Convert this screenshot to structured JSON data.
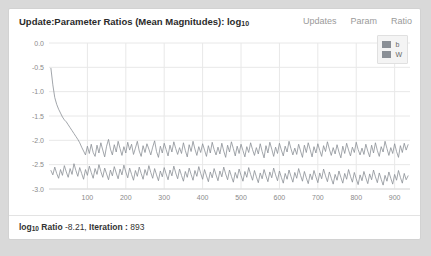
{
  "card": {
    "title_main": "Update:Parameter Ratios (Mean Magnitudes): log",
    "title_sub": "10"
  },
  "tabs": [
    {
      "label": "Updates"
    },
    {
      "label": "Param"
    },
    {
      "label": "Ratio"
    }
  ],
  "legend": {
    "position": "top-right",
    "items": [
      {
        "label": "b",
        "color": "#8a8f96"
      },
      {
        "label": "W",
        "color": "#8a8f96"
      }
    ]
  },
  "footer": {
    "prefix": "log",
    "prefix_sub": "10",
    "ratio_label": "Ratio",
    "ratio_value": "-8.21",
    "separator": ",",
    "iteration_label": "Iteration :",
    "iteration_value": "893"
  },
  "colors": {
    "page_background": "#d9d9d9",
    "card_background": "#ffffff",
    "card_border": "#d2d2d2",
    "grid": "#e8e8e8",
    "axis_text": "#8a8a8a",
    "series_b": "#8a8f96",
    "series_w": "#8a8f96",
    "title_text": "#2b2b2b",
    "tab_text": "#9a9a9a"
  },
  "chart_data": {
    "type": "line",
    "title": "Update:Parameter Ratios (Mean Magnitudes): log10",
    "xlabel": "",
    "ylabel": "",
    "xlim": [
      0,
      940
    ],
    "ylim": [
      -3.0,
      0.0
    ],
    "grid": true,
    "legend_position": "top-right",
    "xticks": [
      100,
      200,
      300,
      400,
      500,
      600,
      700,
      800,
      900
    ],
    "yticks": [
      "0.0",
      "-0.5",
      "-1.0",
      "-1.5",
      "-2.0",
      "-2.5",
      "-3.0"
    ],
    "x_start": 5,
    "x_step": 5,
    "series": [
      {
        "name": "b",
        "color": "#8a8f96",
        "values": [
          -0.52,
          -0.86,
          -1.12,
          -1.26,
          -1.36,
          -1.44,
          -1.52,
          -1.58,
          -1.62,
          -1.68,
          -1.74,
          -1.8,
          -1.86,
          -1.92,
          -1.98,
          -2.05,
          -2.14,
          -2.22,
          -2.3,
          -2.12,
          -2.27,
          -2.08,
          -2.25,
          -2.33,
          -2.1,
          -2.26,
          -2.05,
          -2.2,
          -2.34,
          -2.12,
          -1.98,
          -2.18,
          -2.3,
          -2.09,
          -2.24,
          -2.02,
          -2.17,
          -2.31,
          -2.13,
          -2.26,
          -2.04,
          -2.2,
          -2.08,
          -2.29,
          -2.16,
          -2.02,
          -2.22,
          -2.33,
          -2.11,
          -2.25,
          -2.07,
          -2.18,
          -2.3,
          -2.14,
          -2.01,
          -2.23,
          -2.35,
          -2.12,
          -2.26,
          -2.06,
          -2.19,
          -2.32,
          -2.1,
          -2.24,
          -2.03,
          -2.17,
          -2.29,
          -2.15,
          -2.27,
          -2.05,
          -2.21,
          -2.34,
          -2.09,
          -2.23,
          -2.02,
          -2.18,
          -2.31,
          -2.13,
          -2.25,
          -2.07,
          -2.2,
          -2.33,
          -2.11,
          -2.26,
          -2.04,
          -2.19,
          -2.3,
          -2.14,
          -2.28,
          -2.06,
          -2.22,
          -2.35,
          -2.1,
          -2.24,
          -2.03,
          -2.17,
          -2.32,
          -2.12,
          -2.27,
          -2.08,
          -2.21,
          -2.34,
          -2.13,
          -2.25,
          -2.05,
          -2.19,
          -2.31,
          -2.15,
          -2.28,
          -2.07,
          -2.23,
          -2.36,
          -2.11,
          -2.26,
          -2.04,
          -2.18,
          -2.33,
          -2.14,
          -2.27,
          -2.06,
          -2.2,
          -2.32,
          -2.12,
          -2.24,
          -2.02,
          -2.17,
          -2.3,
          -2.16,
          -2.29,
          -2.08,
          -2.22,
          -2.35,
          -2.1,
          -2.25,
          -2.05,
          -2.19,
          -2.34,
          -2.13,
          -2.26,
          -2.07,
          -2.21,
          -2.33,
          -2.11,
          -2.23,
          -2.03,
          -2.18,
          -2.31,
          -2.15,
          -2.28,
          -2.09,
          -2.24,
          -2.36,
          -2.12,
          -2.27,
          -2.06,
          -2.2,
          -2.32,
          -2.14,
          -2.25,
          -2.04,
          -2.19,
          -2.3,
          -2.16,
          -2.29,
          -2.08,
          -2.22,
          -2.34,
          -2.1,
          -2.26,
          -2.05,
          -2.21,
          -2.33,
          -2.13,
          -2.24,
          -2.02,
          -2.17,
          -2.31,
          -2.15,
          -2.27,
          -2.07,
          -2.23,
          -2.35,
          -2.11,
          -2.25,
          -2.06,
          -2.2,
          -2.09
        ]
      },
      {
        "name": "W",
        "color": "#8a8f96",
        "values": [
          -2.62,
          -2.71,
          -2.55,
          -2.68,
          -2.78,
          -2.6,
          -2.72,
          -2.52,
          -2.65,
          -2.76,
          -2.58,
          -2.7,
          -2.48,
          -2.62,
          -2.74,
          -2.56,
          -2.68,
          -2.8,
          -2.6,
          -2.72,
          -2.53,
          -2.66,
          -2.78,
          -2.58,
          -2.7,
          -2.5,
          -2.64,
          -2.76,
          -2.57,
          -2.69,
          -2.81,
          -2.61,
          -2.73,
          -2.54,
          -2.67,
          -2.79,
          -2.59,
          -2.71,
          -2.51,
          -2.65,
          -2.77,
          -2.57,
          -2.7,
          -2.82,
          -2.62,
          -2.74,
          -2.55,
          -2.68,
          -2.8,
          -2.6,
          -2.72,
          -2.52,
          -2.66,
          -2.78,
          -2.58,
          -2.71,
          -2.83,
          -2.63,
          -2.75,
          -2.56,
          -2.69,
          -2.81,
          -2.61,
          -2.73,
          -2.53,
          -2.67,
          -2.79,
          -2.59,
          -2.72,
          -2.84,
          -2.64,
          -2.76,
          -2.57,
          -2.7,
          -2.82,
          -2.62,
          -2.74,
          -2.54,
          -2.68,
          -2.8,
          -2.6,
          -2.73,
          -2.85,
          -2.65,
          -2.77,
          -2.58,
          -2.71,
          -2.83,
          -2.63,
          -2.75,
          -2.55,
          -2.69,
          -2.81,
          -2.61,
          -2.74,
          -2.86,
          -2.66,
          -2.78,
          -2.59,
          -2.72,
          -2.84,
          -2.64,
          -2.76,
          -2.56,
          -2.7,
          -2.82,
          -2.62,
          -2.75,
          -2.87,
          -2.67,
          -2.79,
          -2.6,
          -2.73,
          -2.85,
          -2.65,
          -2.77,
          -2.57,
          -2.71,
          -2.83,
          -2.63,
          -2.76,
          -2.88,
          -2.68,
          -2.8,
          -2.61,
          -2.74,
          -2.86,
          -2.66,
          -2.78,
          -2.58,
          -2.72,
          -2.84,
          -2.64,
          -2.77,
          -2.89,
          -2.69,
          -2.81,
          -2.62,
          -2.75,
          -2.87,
          -2.67,
          -2.79,
          -2.59,
          -2.73,
          -2.85,
          -2.65,
          -2.78,
          -2.9,
          -2.7,
          -2.82,
          -2.63,
          -2.76,
          -2.88,
          -2.68,
          -2.8,
          -2.6,
          -2.74,
          -2.86,
          -2.66,
          -2.79,
          -2.91,
          -2.71,
          -2.83,
          -2.64,
          -2.77,
          -2.89,
          -2.69,
          -2.81,
          -2.61,
          -2.75,
          -2.87,
          -2.67,
          -2.8,
          -2.92,
          -2.72,
          -2.84,
          -2.65,
          -2.78,
          -2.9,
          -2.7,
          -2.82,
          -2.62,
          -2.76,
          -2.88,
          -2.68,
          -2.81,
          -2.73
        ]
      }
    ]
  }
}
